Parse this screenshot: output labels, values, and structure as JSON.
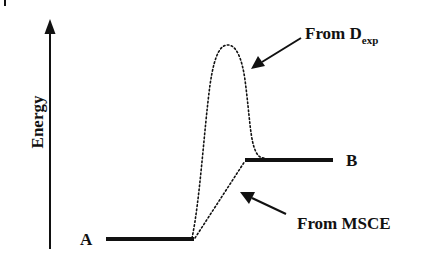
{
  "diagram": {
    "type": "energy-level-diagram",
    "axis": {
      "label": "Energy",
      "direction": "up"
    },
    "levels": [
      {
        "id": "A",
        "label": "A",
        "relative_position": "low"
      },
      {
        "id": "B",
        "label": "B",
        "relative_position": "high"
      }
    ],
    "paths": [
      {
        "id": "dexp",
        "style": "dotted",
        "shape": "barrier-peak",
        "annotation": "From D",
        "annotation_subscript": "exp"
      },
      {
        "id": "msce",
        "style": "dotted",
        "shape": "straight",
        "annotation": "From MSCE"
      }
    ],
    "colors": {
      "ink": "#111111",
      "background": "#ffffff"
    }
  }
}
